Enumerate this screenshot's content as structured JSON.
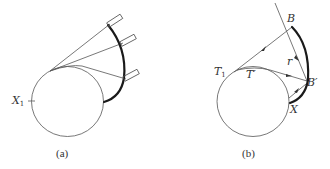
{
  "panel_a": {
    "caption": "(a)",
    "labels": {
      "x1_main": "X",
      "x1_sub": "1"
    }
  },
  "panel_b": {
    "caption": "(b)",
    "labels": {
      "b": "B",
      "b_prime": "B",
      "prime": "′",
      "t1_main": "T",
      "t1_sub": "1",
      "t_prime_main": "T",
      "r": "r",
      "x": "X"
    }
  },
  "colors": {
    "line": "#555555",
    "thick": "#1a1a1a",
    "text": "#333333"
  }
}
